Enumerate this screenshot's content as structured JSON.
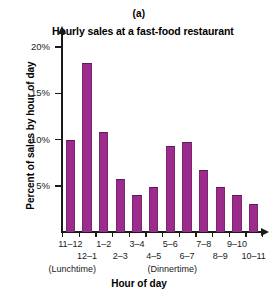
{
  "figure": {
    "panel_label": "(a)",
    "title": "Hourly sales at a fast-food restaurant",
    "xlabel": "Hour of day",
    "ylabel": "Percent of sales by hour of day",
    "bar_color": "#9c2c8c",
    "axis_color": "#1a1a1a"
  },
  "yaxis": {
    "ticks": [
      {
        "label": "5%",
        "value": 5
      },
      {
        "label": "10%",
        "value": 10
      },
      {
        "label": "15%",
        "value": 15
      },
      {
        "label": "20%",
        "value": 20
      }
    ]
  },
  "annotations": [
    {
      "text": "(Lunchtime)",
      "index": 0
    },
    {
      "text": "(Dinnertime)",
      "index": 6
    }
  ],
  "chart_data": {
    "type": "bar",
    "title": "Hourly sales at a fast-food restaurant",
    "subtitle": "(a)",
    "xlabel": "Hour of day",
    "ylabel": "Percent of sales by hour of day",
    "categories": [
      "11–12",
      "12–1",
      "1–2",
      "2–3",
      "3–4",
      "4–5",
      "5–6",
      "6–7",
      "7–8",
      "8–9",
      "9–10",
      "10–11"
    ],
    "values": [
      10.0,
      18.3,
      10.8,
      5.7,
      4.0,
      4.9,
      9.3,
      9.7,
      6.7,
      4.9,
      4.0,
      3.0
    ],
    "ylim": [
      0,
      20
    ],
    "yticks": [
      5,
      10,
      15,
      20
    ],
    "ytick_labels": [
      "5%",
      "10%",
      "15%",
      "20%"
    ],
    "grid": false,
    "legend": false,
    "annotations": [
      "(Lunchtime)",
      "(Dinnertime)"
    ]
  }
}
